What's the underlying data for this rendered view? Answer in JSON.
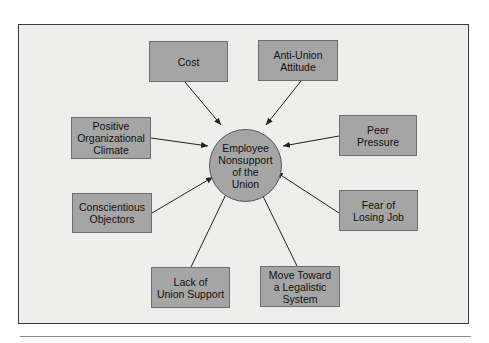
{
  "diagram": {
    "center": {
      "label": "Employee\nNonsupport\nof the\nUnion"
    },
    "factors": [
      {
        "id": "cost",
        "label": "Cost"
      },
      {
        "id": "anti-union-attitude",
        "label": "Anti-Union\nAttitude"
      },
      {
        "id": "positive-organizational-climate",
        "label": "Positive\nOrganizational\nClimate"
      },
      {
        "id": "peer-pressure",
        "label": "Peer\nPressure"
      },
      {
        "id": "conscientious-objectors",
        "label": "Conscientious\nObjectors"
      },
      {
        "id": "fear-of-losing-job",
        "label": "Fear of\nLosing Job"
      },
      {
        "id": "lack-of-union-support",
        "label": "Lack of\nUnion Support"
      },
      {
        "id": "move-toward-legalistic-system",
        "label": "Move Toward\na Legalistic\nSystem"
      }
    ],
    "colors": {
      "box_fill": "#a5a5a5",
      "frame_fill": "#eeeeec",
      "stroke": "#222222"
    }
  }
}
